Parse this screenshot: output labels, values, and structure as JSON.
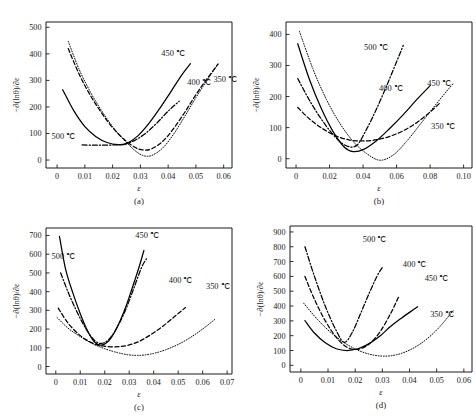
{
  "figure": {
    "panel_count": 4,
    "series_names": [
      "350 ℃",
      "400 ℃",
      "450 ℃",
      "500 ℃"
    ],
    "line_styles": {
      "350 ℃": "dotted",
      "400 ℃": "dashed",
      "450 ℃": "solid",
      "500 ℃": "dashdot"
    },
    "line_color": "#000000"
  },
  "chart_data": [
    {
      "type": "line",
      "panel": "(a)",
      "title": "",
      "xlabel": "ε",
      "ylabel": "−∂(lnθ)/∂ε",
      "xlim": [
        -0.004,
        0.063
      ],
      "ylim": [
        -30,
        520
      ],
      "xticks": [
        0,
        0.01,
        0.02,
        0.03,
        0.04,
        0.05,
        0.06
      ],
      "xticklabels": [
        "0",
        "0.01",
        "0.02",
        "0.03",
        "0.04",
        "0.05",
        "0.06"
      ],
      "yticks": [
        0,
        100,
        200,
        300,
        400,
        500
      ],
      "yticklabels": [
        "0",
        "100",
        "200",
        "300",
        "400",
        "500"
      ],
      "grid": false,
      "legend_position": "inline-annotations",
      "series": [
        {
          "name": "350 ℃",
          "style": "dotted",
          "x": [
            0.004,
            0.008,
            0.012,
            0.016,
            0.02,
            0.024,
            0.028,
            0.031,
            0.034,
            0.038,
            0.042,
            0.046,
            0.05,
            0.054,
            0.058
          ],
          "y": [
            447,
            340,
            256,
            186,
            126,
            77,
            36,
            17,
            17,
            45,
            98,
            165,
            235,
            300,
            362
          ]
        },
        {
          "name": "400 ℃",
          "style": "dashed",
          "x": [
            0.004,
            0.008,
            0.012,
            0.016,
            0.02,
            0.024,
            0.028,
            0.031,
            0.034,
            0.038,
            0.042,
            0.046,
            0.05,
            0.054,
            0.058
          ],
          "y": [
            420,
            322,
            243,
            178,
            122,
            79,
            48,
            38,
            42,
            70,
            119,
            180,
            246,
            306,
            362
          ],
          "annotation": "400 ℃"
        },
        {
          "name": "450 ℃",
          "style": "solid",
          "x": [
            0.002,
            0.006,
            0.01,
            0.014,
            0.018,
            0.022,
            0.025,
            0.029,
            0.033,
            0.037,
            0.041,
            0.045,
            0.048
          ],
          "y": [
            265,
            186,
            126,
            88,
            66,
            58,
            62,
            90,
            137,
            195,
            258,
            322,
            363
          ],
          "annotation": "450 ℃"
        },
        {
          "name": "500 ℃",
          "style": "dashdot",
          "x": [
            0.009,
            0.013,
            0.017,
            0.021,
            0.024,
            0.028,
            0.032,
            0.036,
            0.04,
            0.044
          ],
          "y": [
            57,
            56,
            56,
            57,
            59,
            74,
            102,
            140,
            184,
            222
          ],
          "annotation": "500 ℃"
        }
      ]
    },
    {
      "type": "line",
      "panel": "(b)",
      "title": "",
      "xlabel": "ε",
      "ylabel": "−∂(lnθ)/∂ε",
      "xlim": [
        -0.006,
        0.105
      ],
      "ylim": [
        -30,
        440
      ],
      "xticks": [
        0,
        0.02,
        0.04,
        0.06,
        0.08,
        0.1
      ],
      "xticklabels": [
        "0",
        "0.02",
        "0.04",
        "0.06",
        "0.08",
        "0.10"
      ],
      "yticks": [
        0,
        100,
        200,
        300,
        400
      ],
      "yticklabels": [
        "0",
        "100",
        "200",
        "300",
        "400"
      ],
      "grid": false,
      "legend_position": "inline-annotations",
      "series": [
        {
          "name": "350 ℃",
          "style": "dotted",
          "x": [
            0.002,
            0.01,
            0.018,
            0.026,
            0.034,
            0.042,
            0.05,
            0.058,
            0.066,
            0.074,
            0.082,
            0.09,
            0.094
          ],
          "y": [
            410,
            290,
            192,
            115,
            56,
            17,
            -5,
            12,
            56,
            110,
            165,
            218,
            243
          ],
          "annotation": "350 ℃"
        },
        {
          "name": "400 ℃",
          "style": "dashed",
          "x": [
            0.001,
            0.008,
            0.016,
            0.024,
            0.032,
            0.04,
            0.048,
            0.056,
            0.064,
            0.072,
            0.08,
            0.086
          ],
          "y": [
            165,
            128,
            96,
            73,
            60,
            57,
            61,
            72,
            90,
            116,
            150,
            180
          ],
          "annotation": "400 ℃"
        },
        {
          "name": "450 ℃",
          "style": "solid",
          "x": [
            0.001,
            0.008,
            0.015,
            0.022,
            0.029,
            0.034,
            0.04,
            0.048,
            0.056,
            0.064,
            0.072,
            0.08
          ],
          "y": [
            370,
            255,
            162,
            88,
            36,
            23,
            29,
            58,
            98,
            142,
            190,
            235
          ],
          "annotation": "450 ℃"
        },
        {
          "name": "500 ℃",
          "style": "dashdot",
          "x": [
            0.001,
            0.008,
            0.015,
            0.022,
            0.029,
            0.036,
            0.042,
            0.048,
            0.054,
            0.06,
            0.064
          ],
          "y": [
            258,
            188,
            128,
            78,
            44,
            42,
            94,
            160,
            234,
            312,
            365
          ],
          "annotation": "500 ℃"
        }
      ]
    },
    {
      "type": "line",
      "panel": "(c)",
      "title": "",
      "xlabel": "ε",
      "ylabel": "−∂(lnθ)/∂ε",
      "xlim": [
        -0.004,
        0.072
      ],
      "ylim": [
        -40,
        740
      ],
      "xticks": [
        0,
        0.01,
        0.02,
        0.03,
        0.04,
        0.05,
        0.06,
        0.07
      ],
      "xticklabels": [
        "0",
        "0.01",
        "0.02",
        "0.03",
        "0.04",
        "0.05",
        "0.06",
        "0.07"
      ],
      "yticks": [
        0,
        100,
        200,
        300,
        400,
        500,
        600,
        700
      ],
      "yticklabels": [
        "0",
        "100",
        "200",
        "300",
        "400",
        "500",
        "600",
        "700"
      ],
      "grid": false,
      "legend_position": "inline-annotations",
      "series": [
        {
          "name": "350 ℃",
          "style": "dotted",
          "x": [
            0.0005,
            0.005,
            0.01,
            0.015,
            0.02,
            0.025,
            0.03,
            0.035,
            0.04,
            0.045,
            0.05,
            0.055,
            0.06,
            0.065
          ],
          "y": [
            262,
            205,
            160,
            122,
            95,
            75,
            62,
            60,
            70,
            90,
            118,
            155,
            200,
            252
          ],
          "annotation": "350 ℃"
        },
        {
          "name": "400 ℃",
          "style": "dashed",
          "x": [
            0.001,
            0.005,
            0.01,
            0.015,
            0.019,
            0.024,
            0.029,
            0.034,
            0.039,
            0.044,
            0.049,
            0.053
          ],
          "y": [
            312,
            232,
            165,
            125,
            110,
            105,
            112,
            134,
            172,
            218,
            272,
            315
          ],
          "annotation": "400 ℃"
        },
        {
          "name": "450 ℃",
          "style": "solid",
          "x": [
            0.0015,
            0.004,
            0.007,
            0.01,
            0.013,
            0.016,
            0.019,
            0.022,
            0.025,
            0.028,
            0.031,
            0.034,
            0.036
          ],
          "y": [
            695,
            520,
            392,
            282,
            190,
            128,
            115,
            142,
            208,
            298,
            410,
            530,
            620
          ],
          "annotation": "450 ℃"
        },
        {
          "name": "500 ℃",
          "style": "dashdot",
          "x": [
            0.002,
            0.005,
            0.008,
            0.011,
            0.014,
            0.017,
            0.02,
            0.023,
            0.026,
            0.029,
            0.032,
            0.035,
            0.037
          ],
          "y": [
            500,
            398,
            310,
            232,
            168,
            128,
            128,
            165,
            232,
            318,
            422,
            528,
            575
          ],
          "annotation": "500 ℃"
        }
      ]
    },
    {
      "type": "line",
      "panel": "(d)",
      "title": "",
      "xlabel": "ε",
      "ylabel": "−∂(lnθ)/∂ε",
      "xlim": [
        -0.004,
        0.063
      ],
      "ylim": [
        -45,
        940
      ],
      "xticks": [
        0,
        0.01,
        0.02,
        0.03,
        0.04,
        0.05,
        0.06
      ],
      "xticklabels": [
        "0",
        "0.01",
        "0.02",
        "0.03",
        "0.04",
        "0.05",
        "0.06"
      ],
      "yticks": [
        0,
        100,
        200,
        300,
        400,
        500,
        600,
        700,
        800,
        900
      ],
      "yticklabels": [
        "0",
        "100",
        "200",
        "300",
        "400",
        "500",
        "600",
        "700",
        "800",
        "900"
      ],
      "grid": false,
      "legend_position": "inline-annotations",
      "series": [
        {
          "name": "350 ℃",
          "style": "dotted",
          "x": [
            0.001,
            0.006,
            0.011,
            0.016,
            0.021,
            0.026,
            0.031,
            0.036,
            0.041,
            0.046,
            0.051,
            0.056
          ],
          "y": [
            420,
            312,
            222,
            152,
            102,
            72,
            62,
            75,
            112,
            172,
            258,
            368
          ],
          "annotation": "350 ℃"
        },
        {
          "name": "400 ℃",
          "style": "dashed",
          "x": [
            0.0015,
            0.005,
            0.009,
            0.013,
            0.017,
            0.021,
            0.025,
            0.029,
            0.033,
            0.036
          ],
          "y": [
            600,
            445,
            300,
            190,
            122,
            108,
            142,
            222,
            348,
            462
          ],
          "annotation": "400 ℃"
        },
        {
          "name": "450 ℃",
          "style": "solid",
          "x": [
            0.0015,
            0.005,
            0.009,
            0.013,
            0.017,
            0.021,
            0.025,
            0.029,
            0.033,
            0.037,
            0.041,
            0.043
          ],
          "y": [
            302,
            218,
            152,
            112,
            100,
            112,
            145,
            196,
            262,
            318,
            370,
            395
          ],
          "annotation": "450 ℃"
        },
        {
          "name": "500 ℃",
          "style": "dashdot",
          "x": [
            0.0015,
            0.005,
            0.009,
            0.013,
            0.016,
            0.019,
            0.022,
            0.025,
            0.028,
            0.03
          ],
          "y": [
            800,
            600,
            398,
            235,
            155,
            225,
            350,
            480,
            600,
            660
          ],
          "annotation": "500 ℃"
        }
      ]
    }
  ]
}
